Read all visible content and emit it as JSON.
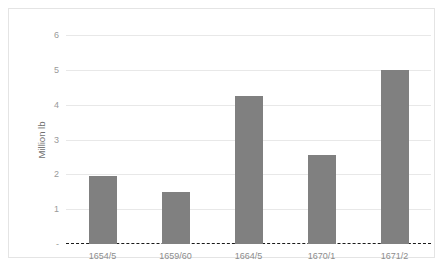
{
  "chart_data": {
    "type": "bar",
    "title": "",
    "subtitle": "",
    "xlabel": "",
    "ylabel": "Million lb",
    "categories": [
      "1654/5",
      "1659/60",
      "1664/5",
      "1670/1",
      "1671/2"
    ],
    "values": [
      1.95,
      1.5,
      4.25,
      2.55,
      5.0
    ],
    "series": [
      {
        "name": "Million lb",
        "values": [
          1.95,
          1.5,
          4.25,
          2.55,
          5.0
        ]
      }
    ],
    "ylim": [
      0,
      6
    ],
    "y_ticks": [
      "-",
      "1",
      "2",
      "3",
      "4",
      "5",
      "6"
    ],
    "y_tick_values": [
      0,
      1,
      2,
      3,
      4,
      5,
      6
    ],
    "grid": true,
    "grid_axis": "y",
    "legend": "none",
    "legend_position": "none",
    "annotations": [],
    "colors": {
      "bar": "#808080",
      "gridline": "#e8e8e8",
      "baseline": "#1a1a1a",
      "tick_text": "#9a9a9a",
      "category_text": "#8d8d8d",
      "axis_title": "#6f6f6f",
      "frame": "#e4e4e4",
      "background": "#ffffff"
    }
  }
}
